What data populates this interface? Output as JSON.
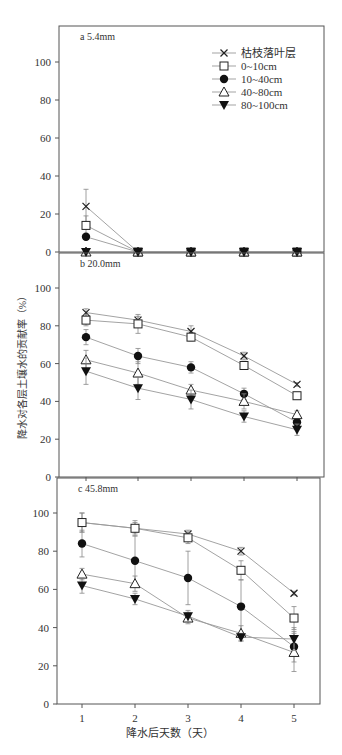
{
  "chart_data": [
    {
      "type": "line",
      "title": "a 5.4mm",
      "x": [
        1,
        2,
        3,
        4,
        5
      ],
      "ylim": [
        0,
        118
      ],
      "yticks": [
        0,
        20,
        40,
        60,
        80,
        100
      ],
      "series": [
        {
          "name": "枯枝落叶层",
          "marker": "x",
          "values": [
            24,
            0,
            0,
            0,
            0
          ],
          "err": [
            9,
            0,
            0,
            0,
            0
          ]
        },
        {
          "name": "0~10cm",
          "marker": "square-open",
          "values": [
            14,
            0,
            0,
            0,
            0
          ],
          "err": [
            5,
            0,
            0,
            0,
            0
          ]
        },
        {
          "name": "10~40cm",
          "marker": "circle-filled",
          "values": [
            8,
            0,
            0,
            0,
            0
          ],
          "err": [
            0,
            0,
            0,
            0,
            0
          ]
        },
        {
          "name": "40~80cm",
          "marker": "triangle-open",
          "values": [
            0,
            0,
            0,
            0,
            0
          ],
          "err": [
            0,
            0,
            0,
            0,
            0
          ]
        },
        {
          "name": "80~100cm",
          "marker": "triangle-down-filled",
          "values": [
            0,
            0,
            0,
            0,
            0
          ],
          "err": [
            0,
            0,
            0,
            0,
            0
          ]
        }
      ]
    },
    {
      "type": "line",
      "title": "b 20.0mm",
      "x": [
        1,
        2,
        3,
        4,
        5
      ],
      "ylim": [
        0,
        118
      ],
      "yticks": [
        0,
        20,
        40,
        60,
        80,
        100
      ],
      "series": [
        {
          "name": "枯枝落叶层",
          "marker": "x",
          "values": [
            87,
            83,
            77,
            64,
            49
          ],
          "err": [
            2,
            2,
            3,
            2,
            1
          ]
        },
        {
          "name": "0~10cm",
          "marker": "square-open",
          "values": [
            83,
            81,
            74,
            59,
            43
          ],
          "err": [
            3,
            5,
            2,
            2,
            1
          ]
        },
        {
          "name": "10~40cm",
          "marker": "circle-filled",
          "values": [
            74,
            64,
            58,
            44,
            29
          ],
          "err": [
            4,
            4,
            3,
            3,
            2
          ]
        },
        {
          "name": "40~80cm",
          "marker": "triangle-open",
          "values": [
            62,
            55,
            46,
            40,
            33
          ],
          "err": [
            5,
            6,
            3,
            4,
            2
          ]
        },
        {
          "name": "80~100cm",
          "marker": "triangle-down-filled",
          "values": [
            56,
            47,
            41,
            32,
            25
          ],
          "err": [
            7,
            6,
            5,
            3,
            3
          ]
        }
      ]
    },
    {
      "type": "line",
      "title": "c 45.8mm",
      "x": [
        1,
        2,
        3,
        4,
        5
      ],
      "xlabel": "降水后天数（天）",
      "ylim": [
        0,
        118
      ],
      "yticks": [
        0,
        20,
        40,
        60,
        80,
        100
      ],
      "series": [
        {
          "name": "枯枝落叶层",
          "marker": "x",
          "values": [
            95,
            92,
            89,
            80,
            58
          ],
          "err": [
            5,
            3,
            2,
            2,
            1
          ]
        },
        {
          "name": "0~10cm",
          "marker": "square-open",
          "values": [
            95,
            92,
            87,
            70,
            45
          ],
          "err": [
            5,
            4,
            3,
            5,
            6
          ]
        },
        {
          "name": "10~40cm",
          "marker": "circle-filled",
          "values": [
            84,
            75,
            66,
            51,
            30
          ],
          "err": [
            7,
            13,
            14,
            14,
            8
          ]
        },
        {
          "name": "40~80cm",
          "marker": "triangle-open",
          "values": [
            68,
            63,
            45,
            37,
            27
          ],
          "err": [
            3,
            4,
            3,
            4,
            10
          ]
        },
        {
          "name": "80~100cm",
          "marker": "triangle-down-filled",
          "values": [
            62,
            55,
            46,
            35,
            34
          ],
          "err": [
            4,
            3,
            3,
            2,
            6
          ]
        }
      ]
    }
  ],
  "shared": {
    "ylabel": "降水对各层土壤水的贡献率（%）",
    "xlabel": "降水后天数（天）",
    "xticks": [
      "1",
      "2",
      "3",
      "4",
      "5"
    ],
    "yticks": [
      "0",
      "20",
      "40",
      "60",
      "80",
      "100"
    ],
    "legend": [
      "枯枝落叶层",
      "0~10cm",
      "10~40cm",
      "40~80cm",
      "80~100cm"
    ],
    "caption_fragment": "…（图注截断）"
  }
}
